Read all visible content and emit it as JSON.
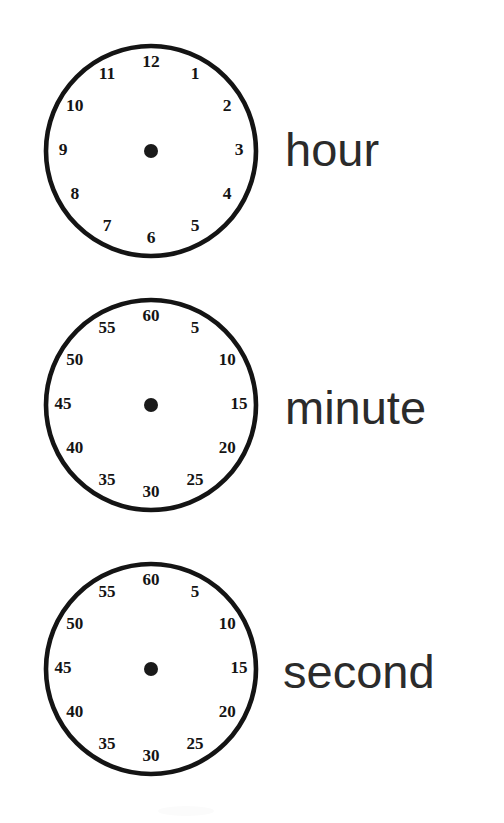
{
  "page": {
    "background_color": "#ffffff",
    "ink_color": "#141414",
    "width": 504,
    "height": 823
  },
  "clocks": [
    {
      "id": "hour",
      "label": "hour",
      "face_name": "hour-clock-face",
      "numeral_count": 12,
      "numerals": [
        "12",
        "1",
        "2",
        "3",
        "4",
        "5",
        "6",
        "7",
        "8",
        "9",
        "10",
        "11"
      ],
      "center": {
        "x": 150,
        "y": 150
      },
      "radius": 107,
      "numeral_radius": 88,
      "hub_radius": 7,
      "hands": []
    },
    {
      "id": "minute",
      "label": "minute",
      "face_name": "minute-clock-face",
      "numeral_count": 12,
      "numerals": [
        "60",
        "5",
        "10",
        "15",
        "20",
        "25",
        "30",
        "35",
        "40",
        "45",
        "50",
        "55"
      ],
      "center": {
        "x": 152,
        "y": 408
      },
      "radius": 107,
      "numeral_radius": 88,
      "hub_radius": 7,
      "hands": []
    },
    {
      "id": "second",
      "label": "second",
      "face_name": "second-clock-face",
      "numeral_count": 12,
      "numerals": [
        "60",
        "5",
        "10",
        "15",
        "20",
        "25",
        "30",
        "35",
        "40",
        "45",
        "50",
        "55"
      ],
      "center": {
        "x": 152,
        "y": 672
      },
      "radius": 107,
      "numeral_radius": 88,
      "hub_radius": 7,
      "hands": []
    }
  ]
}
